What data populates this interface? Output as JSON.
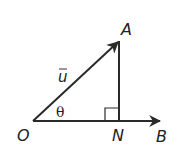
{
  "diagram": {
    "type": "vector-projection-triangle",
    "points": {
      "O": {
        "label": "O",
        "x": 33,
        "y": 121
      },
      "A": {
        "label": "A",
        "x": 119,
        "y": 41
      },
      "N": {
        "label": "N",
        "x": 119,
        "y": 121
      },
      "B": {
        "label": "B",
        "x": 160,
        "y": 121
      }
    },
    "vector_label": "u",
    "angle_label": "θ",
    "right_angle_at": "N",
    "colors": {
      "stroke": "#2a2a2a",
      "text": "#222222",
      "background": "#ffffff"
    }
  }
}
